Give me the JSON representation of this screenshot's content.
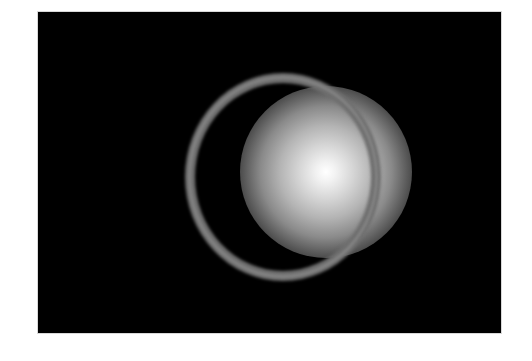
{
  "image": {
    "description": "Glowing white sphere surrounded by a thin gray ring on a black background",
    "frame": {
      "x": 38,
      "y": 12,
      "width": 463,
      "height": 321,
      "background": "#000000"
    },
    "glow": {
      "center_x": 288,
      "center_y": 172,
      "radius": 86,
      "core_color": "#ffffff",
      "edge_color": "#000000"
    },
    "ring": {
      "center_x": 283,
      "center_y": 177,
      "outer_rx": 98,
      "outer_ry": 104,
      "thickness": 10,
      "color": "#6f6f6f"
    }
  }
}
